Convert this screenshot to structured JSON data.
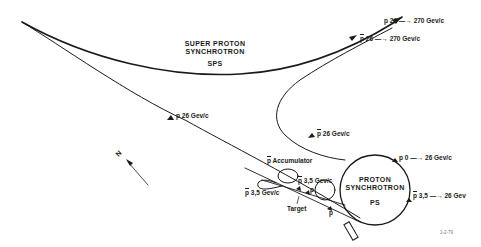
{
  "diagram": {
    "sps": {
      "title_line1": "SUPER PROTON",
      "title_line2": "SYNCHROTRON",
      "abbrev": "SPS"
    },
    "ps": {
      "title_line1": "PROTON",
      "title_line2": "SYNCHROTRON",
      "abbrev": "PS"
    },
    "labels": {
      "p_26_270_particle": "p",
      "p_26_270_text": "26 —→ 270 Gev/c",
      "pbar_26_270_particle": "p",
      "pbar_26_270_text": "26 —→ 270 Gev/c",
      "p_26_transfer_particle": "p",
      "p_26_transfer_text": "26 Gev/c",
      "pbar_26_transfer_particle": "p",
      "pbar_26_transfer_text": "26 Gev/c",
      "p_0_26_particle": "p",
      "p_0_26_text": "0 —→ 26 Gev/c",
      "pbar_35_26_particle": "p",
      "pbar_35_26_text": "3,5 —→ 26 Gev",
      "accumulator_particle": "p",
      "accumulator_text": "Accumulator",
      "pbar_35_upper_particle": "p",
      "pbar_35_upper_text": "3,5 Gev/c",
      "pbar_35_lower_particle": "p",
      "pbar_35_lower_text": "3,5 Gev/c",
      "p_near_target": "p",
      "p_lower": "p",
      "target": "Target",
      "north": "N"
    },
    "date": "1-2-79"
  }
}
